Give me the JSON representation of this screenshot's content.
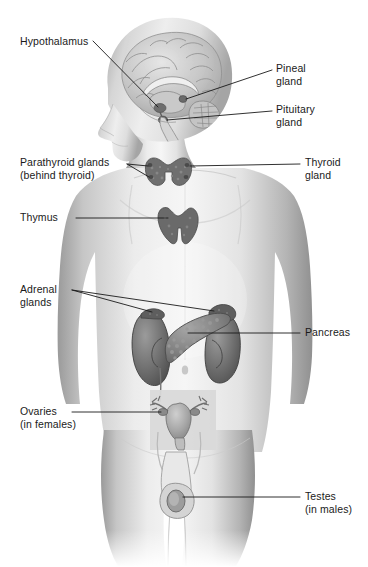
{
  "diagram": {
    "background_color": "#ffffff",
    "line_color": "#1a1a1a",
    "text_color": "#1a1a1a",
    "inset_box_color": "#d8d8d8"
  },
  "labels": {
    "hypothalamus": {
      "line1": "Hypothalamus",
      "line2": ""
    },
    "pineal": {
      "line1": "Pineal",
      "line2": "gland"
    },
    "pituitary": {
      "line1": "Pituitary",
      "line2": "gland"
    },
    "parathyroid": {
      "line1": "Parathyroid glands",
      "line2": "(behind thyroid)"
    },
    "thyroid": {
      "line1": "Thyroid",
      "line2": "gland"
    },
    "thymus": {
      "line1": "Thymus",
      "line2": ""
    },
    "adrenal": {
      "line1": "Adrenal",
      "line2": "glands"
    },
    "pancreas": {
      "line1": "Pancreas",
      "line2": ""
    },
    "ovaries": {
      "line1": "Ovaries",
      "line2": "(in females)"
    },
    "testes": {
      "line1": "Testes",
      "line2": "(in males)"
    }
  },
  "organs": {
    "brain": "brain-sagittal-section",
    "pineal_gland": "pineal-gland",
    "pituitary_gland": "pituitary-gland",
    "hypothalamus": "hypothalamus",
    "thyroid_gland": "thyroid-gland",
    "parathyroid_glands": "parathyroid-glands",
    "thymus": "thymus",
    "adrenal_gland_left": "adrenal-gland-left",
    "adrenal_gland_right": "adrenal-gland-right",
    "kidney_left": "kidney-left",
    "kidney_right": "kidney-right",
    "pancreas": "pancreas",
    "ovaries": "ovaries-uterus-inset",
    "testes": "testes"
  }
}
